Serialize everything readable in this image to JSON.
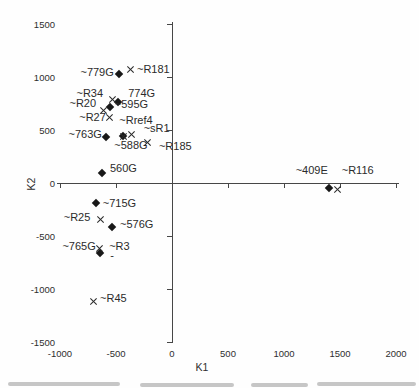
{
  "figure": {
    "background": "#fefefe",
    "axis_color": "#474747",
    "text_color": "#2e2e2e",
    "marker_color": "#181818"
  },
  "chart_data": {
    "type": "scatter",
    "title": "",
    "xlabel": "K1",
    "ylabel": "K2",
    "xlim": [
      -1000,
      2000
    ],
    "ylim": [
      -1500,
      1500
    ],
    "x_ticks": [
      -1000,
      -500,
      0,
      500,
      1000,
      1500,
      2000
    ],
    "y_ticks": [
      1500,
      1000,
      500,
      0,
      -500,
      -1000,
      -1500
    ],
    "grid": false,
    "legend": "none",
    "series": [
      {
        "name": "G-samples",
        "marker": "diamond",
        "points": [
          {
            "label": "~779G",
            "x": -475,
            "y": 1030,
            "dx": -5,
            "dy": -2,
            "anchor": "end"
          },
          {
            "label": "774G",
            "x": -480,
            "y": 765,
            "dx": 10,
            "dy": -9,
            "anchor": "start"
          },
          {
            "label": "~595G",
            "x": -555,
            "y": 720,
            "dx": 5,
            "dy": -3,
            "anchor": "start"
          },
          {
            "label": "~763G",
            "x": -590,
            "y": 435,
            "dx": -4,
            "dy": -3,
            "anchor": "end"
          },
          {
            "label": "~588G",
            "x": -435,
            "y": 440,
            "dx": -9,
            "dy": 9,
            "anchor": "start"
          },
          {
            "label": "560G",
            "x": -625,
            "y": 95,
            "dx": 8,
            "dy": -5,
            "anchor": "start"
          },
          {
            "label": "~409E",
            "x": 1400,
            "y": -45,
            "dx": -1,
            "dy": -18,
            "anchor": "end"
          },
          {
            "label": "~715G",
            "x": -680,
            "y": -190,
            "dx": 7,
            "dy": 0,
            "anchor": "start"
          },
          {
            "label": "~576G",
            "x": -535,
            "y": -415,
            "dx": 8,
            "dy": -3,
            "anchor": "start"
          },
          {
            "label": "~765G",
            "x": -645,
            "y": -660,
            "dx": -4,
            "dy": -7,
            "anchor": "end"
          }
        ]
      },
      {
        "name": "R-samples",
        "marker": "x",
        "points": [
          {
            "label": "~R181",
            "x": -375,
            "y": 1070,
            "dx": 7,
            "dy": -1,
            "anchor": "start"
          },
          {
            "label": "~R34",
            "x": -535,
            "y": 785,
            "dx": -9,
            "dy": -7,
            "anchor": "end"
          },
          {
            "label": "~R20",
            "x": -615,
            "y": 680,
            "dx": -7,
            "dy": -8,
            "anchor": "end"
          },
          {
            "label": "~R27",
            "x": -555,
            "y": 615,
            "dx": -4,
            "dy": -1,
            "anchor": "end"
          },
          {
            "label": "~Rref4",
            "x": -435,
            "y": 440,
            "dx": -4,
            "dy": -16,
            "anchor": "start"
          },
          {
            "label": "~sR1",
            "x": -360,
            "y": 460,
            "dx": 12,
            "dy": -6,
            "anchor": "start"
          },
          {
            "label": "~R185",
            "x": -215,
            "y": 385,
            "dx": 11,
            "dy": 4,
            "anchor": "start"
          },
          {
            "label": "~R116",
            "x": 1480,
            "y": -65,
            "dx": 4,
            "dy": -20,
            "anchor": "start"
          },
          {
            "label": "~R25",
            "x": -640,
            "y": -345,
            "dx": -10,
            "dy": -3,
            "anchor": "end"
          },
          {
            "label": "~R3",
            "x": -650,
            "y": -620,
            "dx": 10,
            "dy": -3,
            "anchor": "start"
          },
          {
            "label": "~R45",
            "x": -705,
            "y": -1120,
            "dx": 7,
            "dy": -4,
            "anchor": "start"
          }
        ]
      }
    ],
    "annotations": [
      {
        "text": "-",
        "x": -535,
        "y": -680
      }
    ]
  }
}
